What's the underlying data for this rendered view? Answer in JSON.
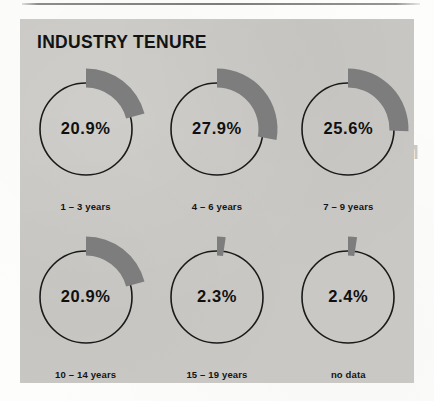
{
  "page": {
    "background_color": "#fdfdfc",
    "panel_color": "#c9c8c4",
    "rule_color": "#6e6e6e"
  },
  "panel": {
    "title": "INDUSTRY TENURE"
  },
  "chart_data": {
    "type": "pie",
    "title": "INDUSTRY TENURE",
    "xlabel": "",
    "ylabel": "",
    "legend": "none",
    "grid": false,
    "units": "percent",
    "arc_start_angle_deg": 0,
    "arc_direction": "clockwise",
    "series_color": "#7d7d7d",
    "outline_color": "#1a1a1a",
    "categories": [
      "1 – 3 years",
      "4 – 6 years",
      "7 – 9 years",
      "10 – 14 years",
      "15 – 19 years",
      "no data"
    ],
    "values": [
      20.9,
      27.9,
      25.6,
      20.9,
      2.3,
      2.4
    ],
    "value_labels": [
      "20.9%",
      "27.9%",
      "25.6%",
      "20.9%",
      "2.3%",
      "2.4%"
    ],
    "slices": [
      {
        "label": "1 – 3 years",
        "value": 20.9,
        "display": "20.9%",
        "color": "#7d7d7d"
      },
      {
        "label": "4 – 6 years",
        "value": 27.9,
        "display": "27.9%",
        "color": "#7d7d7d"
      },
      {
        "label": "7 – 9 years",
        "value": 25.6,
        "display": "25.6%",
        "color": "#7d7d7d"
      },
      {
        "label": "10 – 14 years",
        "value": 20.9,
        "display": "20.9%",
        "color": "#7d7d7d"
      },
      {
        "label": "15 – 19 years",
        "value": 2.3,
        "display": "2.3%",
        "color": "#7d7d7d"
      },
      {
        "label": "no data",
        "value": 2.4,
        "display": "2.4%",
        "color": "#7d7d7d"
      }
    ]
  },
  "bleedthrough": {
    "heading_lines": [
      "What Is",
      "Community",
      "Management?"
    ],
    "body_note": "faint reverse-page text"
  }
}
